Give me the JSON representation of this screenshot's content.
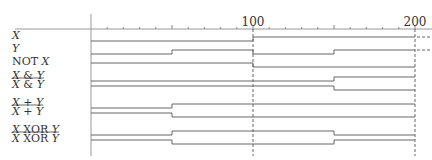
{
  "diagram": {
    "time_axis": {
      "min": 0,
      "max": 200,
      "major_labels": [
        "100",
        "200"
      ],
      "major_values": [
        100,
        200
      ],
      "tick_step": 10,
      "dashed_markers": [
        100,
        200
      ]
    },
    "signals": [
      {
        "label": "X",
        "italic": true,
        "overline": false,
        "segments": [
          {
            "t": 0,
            "v": 0
          },
          {
            "t": 100,
            "v": 1
          }
        ]
      },
      {
        "label": "Y",
        "italic": true,
        "overline": false,
        "segments": [
          {
            "t": 0,
            "v": 0
          },
          {
            "t": 50,
            "v": 1
          },
          {
            "t": 100,
            "v": 0
          },
          {
            "t": 150,
            "v": 1
          }
        ]
      },
      {
        "label": "NOT X",
        "italic": false,
        "overline": false,
        "segments": [
          {
            "t": 0,
            "v": 1
          },
          {
            "t": 100,
            "v": 0
          }
        ]
      },
      {
        "label": "X & Y",
        "italic": true,
        "overline": false,
        "segments": [
          {
            "t": 0,
            "v": 0
          },
          {
            "t": 150,
            "v": 1
          }
        ]
      },
      {
        "label": "X & Y",
        "italic": true,
        "overline": true,
        "segments": [
          {
            "t": 0,
            "v": 1
          },
          {
            "t": 150,
            "v": 0
          }
        ]
      },
      {
        "label": "X + Y",
        "italic": true,
        "overline": false,
        "segments": [
          {
            "t": 0,
            "v": 0
          },
          {
            "t": 50,
            "v": 1
          }
        ]
      },
      {
        "label": "X + Y",
        "italic": true,
        "overline": true,
        "segments": [
          {
            "t": 0,
            "v": 1
          },
          {
            "t": 50,
            "v": 0
          }
        ]
      },
      {
        "label": "X XOR Y",
        "italic": true,
        "overline": false,
        "segments": [
          {
            "t": 0,
            "v": 0
          },
          {
            "t": 50,
            "v": 1
          },
          {
            "t": 150,
            "v": 0
          }
        ]
      },
      {
        "label": "X XOR Y",
        "italic": true,
        "overline": true,
        "segments": [
          {
            "t": 0,
            "v": 1
          },
          {
            "t": 50,
            "v": 0
          },
          {
            "t": 150,
            "v": 1
          }
        ]
      }
    ]
  }
}
